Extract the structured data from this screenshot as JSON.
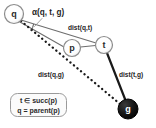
{
  "diagram": {
    "background_color": "#ffffff",
    "nodes": [
      {
        "id": "q",
        "label": "q",
        "cx": 14,
        "cy": 14,
        "r": 9.5,
        "fill": "#ffffff",
        "stroke": "#8c8c8c",
        "text_color": "#2b2b2b"
      },
      {
        "id": "p",
        "label": "p",
        "cx": 72,
        "cy": 48,
        "r": 8.5,
        "fill": "#ffffff",
        "stroke": "#8c8c8c",
        "text_color": "#2b2b2b"
      },
      {
        "id": "t",
        "label": "t",
        "cx": 104,
        "cy": 45,
        "r": 8.5,
        "fill": "#ffffff",
        "stroke": "#8c8c8c",
        "text_color": "#2b2b2b"
      },
      {
        "id": "g",
        "label": "g",
        "cx": 128,
        "cy": 109,
        "r": 10,
        "fill": "#111111",
        "stroke": "#111111",
        "text_color": "#ffffff"
      }
    ],
    "edges": [
      {
        "id": "q-t",
        "from": "q",
        "to": "t",
        "style": "solid-thin",
        "color": "#6e6e6e",
        "label": "dist(q,t)"
      },
      {
        "id": "q-p",
        "from": "q",
        "to": "p",
        "style": "solid-thin",
        "color": "#6e6e6e",
        "label": ""
      },
      {
        "id": "p-t",
        "from": "p",
        "to": "t",
        "style": "solid-thin",
        "color": "#6e6e6e",
        "label": ""
      },
      {
        "id": "q-g",
        "from": "q",
        "to": "g",
        "style": "dotted-thick",
        "color": "#1a1a1a",
        "label": "dist(q,g)"
      },
      {
        "id": "t-g",
        "from": "t",
        "to": "g",
        "style": "solid-thick",
        "color": "#1a1a1a",
        "label": "dist(t,g)"
      }
    ],
    "labels": {
      "angle": "α(q, t, g)",
      "dist_qt": "dist(q,t)",
      "dist_qg": "dist(q,g)",
      "dist_tg": "dist(t,g)"
    },
    "angle_marker": {
      "vertex": "q",
      "name": "alpha-arc",
      "color": "#3a3a3a"
    },
    "legend": {
      "border_color": "#9a9a9a",
      "fill_color": "#fbfbfb",
      "lines": [
        "t ∈ succ(p)",
        "q = parent(p)"
      ]
    }
  }
}
